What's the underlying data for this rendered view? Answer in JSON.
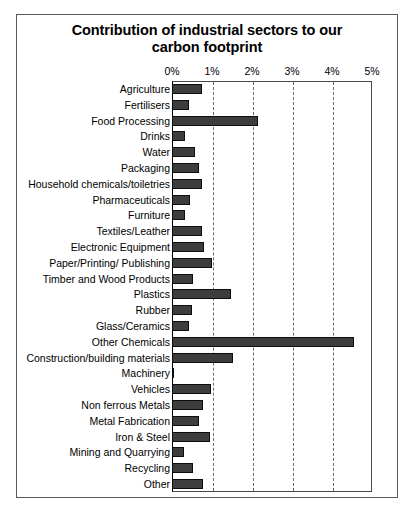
{
  "chart_data": {
    "type": "bar",
    "orientation": "horizontal",
    "title": "Contribution of industrial sectors to our carbon footprint",
    "title_line1": "Contribution of industrial sectors to our",
    "title_line2": "carbon footprint",
    "xlabel": "",
    "ylabel": "",
    "xlim": [
      0,
      5
    ],
    "xtick_labels": [
      "0%",
      "1%",
      "2%",
      "3%",
      "4%",
      "5%"
    ],
    "xticks": [
      0,
      1,
      2,
      3,
      4,
      5
    ],
    "grid": true,
    "grid_axis": "x",
    "legend": false,
    "bar_color": "#3d3d3d",
    "bar_edge_color": "#0d0d0d",
    "units": "percent",
    "categories": [
      "Agriculture",
      "Fertilisers",
      "Food Processing",
      "Drinks",
      "Water",
      "Packaging",
      "Household chemicals/toiletries",
      "Pharmaceuticals",
      "Furniture",
      "Textiles/Leather",
      "Electronic Equipment",
      "Paper/Printing/ Publishing",
      "Timber and Wood Products",
      "Plastics",
      "Rubber",
      "Glass/Ceramics",
      "Other Chemicals",
      "Construction/building materials",
      "Machinery",
      "Vehicles",
      "Non ferrous Metals",
      "Metal Fabrication",
      "Iron & Steel",
      "Mining and Quarrying",
      "Recycling",
      "Other"
    ],
    "values": [
      0.75,
      0.43,
      2.15,
      0.33,
      0.58,
      0.68,
      0.75,
      0.45,
      0.33,
      0.75,
      0.8,
      1.0,
      0.53,
      1.48,
      0.5,
      0.43,
      4.55,
      1.53,
      0.06,
      0.98,
      0.78,
      0.68,
      0.95,
      0.3,
      0.52,
      0.78
    ]
  }
}
